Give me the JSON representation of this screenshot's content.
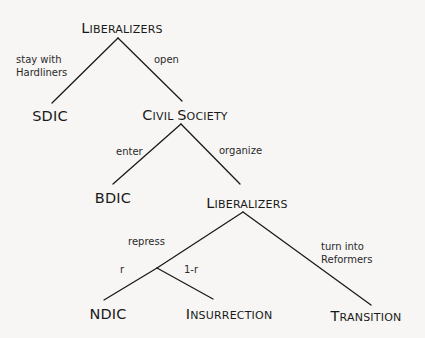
{
  "diagram": {
    "type": "game-tree",
    "nodes": {
      "root": {
        "first": "L",
        "rest": "IBERALIZERS"
      },
      "sdic": {
        "label": "SDIC"
      },
      "civil_society": {
        "first1": "C",
        "rest1": "IVIL ",
        "first2": "S",
        "rest2": "OCIETY"
      },
      "bdic": {
        "label": "BDIC"
      },
      "liberalizers2": {
        "first": "L",
        "rest": "IBERALIZERS"
      },
      "ndic": {
        "label": "NDIC"
      },
      "insurrection": {
        "first": "I",
        "rest": "NSURRECTION"
      },
      "transition": {
        "first": "T",
        "rest": "RANSITION"
      }
    },
    "edges": {
      "stay_with_hardliners": {
        "line1": "stay with",
        "line2": "Hardliners"
      },
      "open": {
        "label": "open"
      },
      "enter": {
        "label": "enter"
      },
      "organize": {
        "label": "organize"
      },
      "repress": {
        "label": "repress"
      },
      "turn_into_reformers": {
        "line1": "turn into",
        "line2": "Reformers"
      },
      "r": {
        "label": "r"
      },
      "one_minus_r": {
        "label": "1-r"
      }
    },
    "line_color": "#1a1a1a",
    "background": "#f7f6f4"
  }
}
